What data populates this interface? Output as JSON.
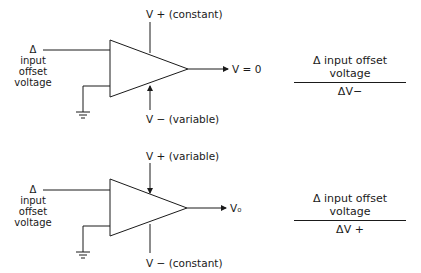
{
  "diagrams": [
    {
      "id": "top",
      "input_label": [
        "Δ",
        "input",
        "offset",
        "voltage"
      ],
      "supply_top_label": "V + (constant)",
      "supply_bottom_label": "V − (variable)",
      "output_label": "V = 0",
      "ratio": {
        "numerator": "Δ input offset voltage",
        "denominator": "ΔV−"
      }
    },
    {
      "id": "bottom",
      "input_label": [
        "Δ",
        "input",
        "offset",
        "voltage"
      ],
      "supply_top_label": "V + (variable)",
      "supply_bottom_label": "V − (constant)",
      "output_label": "V₀",
      "ratio": {
        "numerator": "Δ input offset voltage",
        "denominator": "ΔV +"
      }
    }
  ]
}
